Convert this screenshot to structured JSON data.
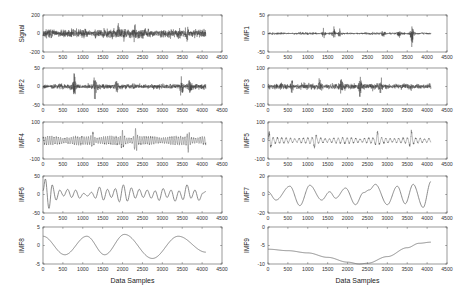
{
  "figure": {
    "width": 465,
    "height": 304,
    "line_color": "#3a3a3a",
    "smooth_line_color": "#6e6e6e",
    "axis_color": "#555555"
  },
  "chart_data": [
    {
      "type": "line",
      "id": "signal",
      "ylabel": "Signal",
      "xlabel": "",
      "xlim": [
        0,
        4500
      ],
      "ylim": [
        -200,
        200
      ],
      "yticks": [
        -200,
        0,
        200
      ],
      "xticks": [
        0,
        500,
        1000,
        1500,
        2000,
        2500,
        3000,
        3500,
        4000,
        4500
      ],
      "n_samples": 4096,
      "style": "noise",
      "amplitude": 45,
      "bursts": [
        [
          2300,
          70
        ],
        [
          3620,
          100
        ],
        [
          1900,
          60
        ],
        [
          2040,
          55
        ]
      ],
      "seed": 11
    },
    {
      "type": "line",
      "id": "imf1",
      "ylabel": "IMF1",
      "xlabel": "",
      "xlim": [
        0,
        4500
      ],
      "ylim": [
        -50,
        50
      ],
      "yticks": [
        -50,
        0,
        50
      ],
      "xticks": [
        0,
        500,
        1000,
        1500,
        2000,
        2500,
        3000,
        3500,
        4000,
        4500
      ],
      "n_samples": 4096,
      "style": "noise",
      "amplitude": 3,
      "bursts": [
        [
          1400,
          12
        ],
        [
          1650,
          15
        ],
        [
          1800,
          12
        ],
        [
          2900,
          14
        ],
        [
          3300,
          18
        ],
        [
          3620,
          32
        ]
      ],
      "seed": 23
    },
    {
      "type": "line",
      "id": "imf2",
      "ylabel": "IMF2",
      "xlabel": "",
      "xlim": [
        0,
        4500
      ],
      "ylim": [
        -50,
        50
      ],
      "yticks": [
        -50,
        0,
        50
      ],
      "xticks": [
        0,
        500,
        1000,
        1500,
        2000,
        2500,
        3000,
        3500,
        4000,
        4500
      ],
      "n_samples": 4096,
      "style": "noise",
      "amplitude": 7,
      "bursts": [
        [
          780,
          35
        ],
        [
          1300,
          38
        ],
        [
          1850,
          22
        ],
        [
          3480,
          32
        ],
        [
          3700,
          20
        ]
      ],
      "seed": 37
    },
    {
      "type": "line",
      "id": "imf3",
      "ylabel": "IMF3",
      "xlabel": "",
      "xlim": [
        0,
        4500
      ],
      "ylim": [
        -100,
        100
      ],
      "yticks": [
        -100,
        0,
        100
      ],
      "xticks": [
        0,
        500,
        1000,
        1500,
        2000,
        2500,
        3000,
        3500,
        4000,
        4500
      ],
      "n_samples": 4096,
      "style": "noise",
      "amplitude": 15,
      "bursts": [
        [
          600,
          40
        ],
        [
          1300,
          42
        ],
        [
          1850,
          38
        ],
        [
          2320,
          70
        ],
        [
          2820,
          48
        ]
      ],
      "seed": 51
    },
    {
      "type": "line",
      "id": "imf4",
      "ylabel": "IMF4",
      "xlabel": "",
      "xlim": [
        0,
        4500
      ],
      "ylim": [
        -100,
        100
      ],
      "yticks": [
        -100,
        0,
        100
      ],
      "xticks": [
        0,
        500,
        1000,
        1500,
        2000,
        2500,
        3000,
        3500,
        4000,
        4500
      ],
      "n_samples": 4096,
      "style": "oscillation",
      "period": 55,
      "amplitude": 20,
      "bursts": [
        [
          2330,
          65
        ],
        [
          2000,
          35
        ],
        [
          3650,
          42
        ],
        [
          1250,
          35
        ]
      ],
      "seed": 67
    },
    {
      "type": "line",
      "id": "imf5",
      "ylabel": "IMF5",
      "xlabel": "",
      "xlim": [
        0,
        4500
      ],
      "ylim": [
        -100,
        100
      ],
      "yticks": [
        -100,
        0,
        100
      ],
      "xticks": [
        0,
        500,
        1000,
        1500,
        2000,
        2500,
        3000,
        3500,
        4000,
        4500
      ],
      "n_samples": 4096,
      "style": "oscillation",
      "period": 110,
      "amplitude": 14,
      "bursts": [
        [
          50,
          50
        ],
        [
          1180,
          35
        ],
        [
          2750,
          38
        ],
        [
          3600,
          42
        ]
      ],
      "seed": 79
    },
    {
      "type": "line",
      "id": "imf6",
      "ylabel": "IMF6",
      "xlabel": "",
      "xlim": [
        0,
        4500
      ],
      "ylim": [
        -50,
        50
      ],
      "yticks": [
        -50,
        0,
        50
      ],
      "xticks": [
        0,
        500,
        1000,
        1500,
        2000,
        2500,
        3000,
        3500,
        4000,
        4500
      ],
      "n_samples": 4096,
      "style": "keypoints",
      "x": [
        0,
        60,
        150,
        230,
        330,
        420,
        520,
        620,
        720,
        820,
        920,
        1020,
        1120,
        1220,
        1320,
        1420,
        1520,
        1620,
        1720,
        1820,
        1920,
        2020,
        2120,
        2220,
        2320,
        2420,
        2520,
        2620,
        2720,
        2820,
        2920,
        3020,
        3120,
        3220,
        3320,
        3420,
        3520,
        3620,
        3720,
        3820,
        3920,
        4020,
        4096
      ],
      "y": [
        10,
        42,
        -38,
        26,
        -15,
        12,
        -4,
        14,
        -8,
        12,
        -10,
        3,
        -4,
        6,
        -10,
        20,
        -15,
        14,
        -8,
        16,
        -20,
        26,
        -18,
        18,
        -10,
        14,
        -8,
        12,
        -10,
        10,
        -16,
        16,
        -8,
        12,
        -18,
        10,
        -14,
        26,
        -10,
        12,
        -16,
        4,
        8
      ],
      "thick": true
    },
    {
      "type": "line",
      "id": "imf7",
      "ylabel": "IMF7",
      "xlabel": "",
      "xlim": [
        0,
        4500
      ],
      "ylim": [
        -20,
        20
      ],
      "yticks": [
        -20,
        0,
        20
      ],
      "xticks": [
        0,
        500,
        1000,
        1500,
        2000,
        2500,
        3000,
        3500,
        4000,
        4500
      ],
      "n_samples": 4096,
      "style": "keypoints",
      "x": [
        0,
        200,
        550,
        800,
        1050,
        1350,
        1550,
        1700,
        1950,
        2200,
        2400,
        2550,
        2700,
        3000,
        3250,
        3450,
        3650,
        3900,
        4096
      ],
      "y": [
        3,
        -6,
        9,
        -12,
        10,
        -6,
        3,
        -4,
        7,
        -11,
        2,
        5,
        11,
        -11,
        9,
        -10,
        11,
        -14,
        14
      ]
    },
    {
      "type": "line",
      "id": "imf8",
      "ylabel": "IMF8",
      "xlabel": "Data Samples",
      "xlim": [
        0,
        4500
      ],
      "ylim": [
        -5,
        5
      ],
      "yticks": [
        -5,
        0,
        5
      ],
      "xticks": [
        0,
        500,
        1000,
        1500,
        2000,
        2500,
        3000,
        3500,
        4000,
        4500
      ],
      "n_samples": 4096,
      "style": "keypoints",
      "x": [
        0,
        550,
        1100,
        1550,
        2050,
        2750,
        3400,
        4096
      ],
      "y": [
        2.5,
        -2.5,
        2.5,
        -2.5,
        3,
        -3.5,
        2.5,
        -1.8
      ]
    },
    {
      "type": "line",
      "id": "imf9",
      "ylabel": "IMF9",
      "xlabel": "Data Samples",
      "xlim": [
        0,
        4500
      ],
      "ylim": [
        -10,
        0
      ],
      "yticks": [
        -10,
        -5,
        0
      ],
      "xticks": [
        0,
        500,
        1000,
        1500,
        2000,
        2500,
        3000,
        3500,
        4000,
        4500
      ],
      "n_samples": 4096,
      "style": "keypoints",
      "x": [
        0,
        500,
        1000,
        1500,
        2000,
        2300,
        2500,
        3000,
        3500,
        3800,
        4096
      ],
      "y": [
        -6,
        -6.4,
        -7,
        -8.2,
        -9.5,
        -10,
        -9.8,
        -8,
        -5.6,
        -4.4,
        -4.1
      ]
    }
  ],
  "layout": {
    "columns": [
      43,
      268
    ],
    "plot_width": 179,
    "rows": [
      15,
      68,
      122,
      176,
      227
    ],
    "plot_height": 37
  }
}
